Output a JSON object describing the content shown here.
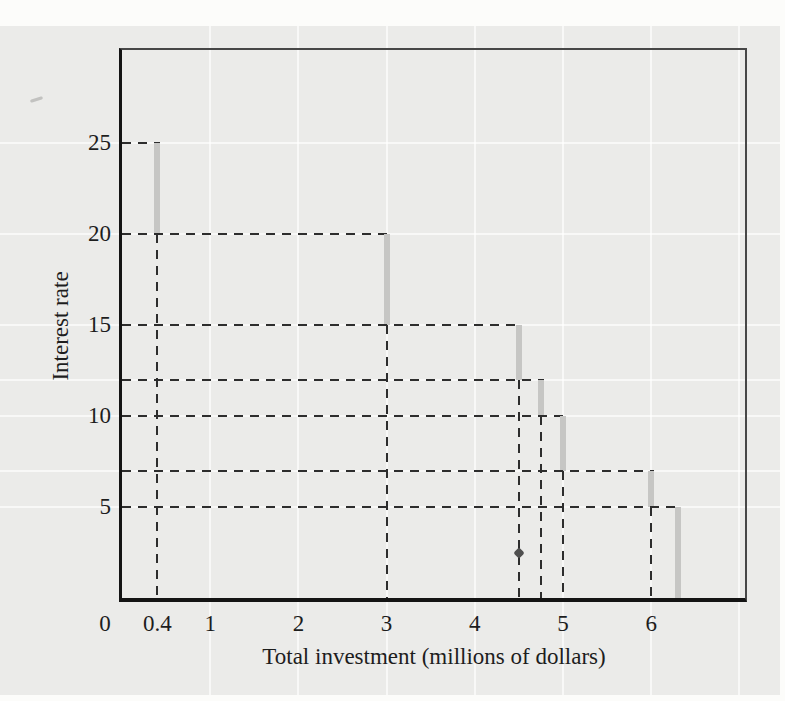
{
  "figure": {
    "x_axis_title": "Total investment (millions of dollars)",
    "y_axis_title": "Interest rate"
  },
  "chart_data": {
    "type": "line",
    "subtype": "descending-staircase-step-function",
    "title": "",
    "xlabel": "Total investment (millions of dollars)",
    "ylabel": "Interest rate",
    "xlim": [
      0,
      7.1
    ],
    "ylim": [
      0,
      30
    ],
    "grid": "faint white gridlines on light gray panel",
    "legend_position": "none",
    "x_ticks": [
      {
        "v": 0,
        "label": "0"
      },
      {
        "v": 0.4,
        "label": "0.4"
      },
      {
        "v": 1,
        "label": "1"
      },
      {
        "v": 2,
        "label": "2"
      },
      {
        "v": 3,
        "label": "3"
      },
      {
        "v": 4,
        "label": "4"
      },
      {
        "v": 5,
        "label": "5"
      },
      {
        "v": 6,
        "label": "6"
      }
    ],
    "y_ticks": [
      {
        "v": 25,
        "label": "25"
      },
      {
        "v": 20,
        "label": "20"
      },
      {
        "v": 15,
        "label": "15"
      },
      {
        "v": 10,
        "label": "10"
      },
      {
        "v": 5,
        "label": "5"
      }
    ],
    "steps": [
      {
        "x": 0.4,
        "y_from": 25,
        "y_to": 20
      },
      {
        "x": 3,
        "y_from": 20,
        "y_to": 15
      },
      {
        "x": 4.5,
        "y_from": 15,
        "y_to": 12
      },
      {
        "x": 4.75,
        "y_from": 12,
        "y_to": 10
      },
      {
        "x": 5,
        "y_from": 10,
        "y_to": 7
      },
      {
        "x": 6,
        "y_from": 7,
        "y_to": 5
      },
      {
        "x": 6.3,
        "y_from": 5,
        "y_to": 0
      }
    ],
    "dashed_guides": {
      "horizontal_from_y_axis_at_rates": [
        25,
        20,
        15,
        12,
        10,
        7,
        5
      ],
      "vertical_to_x_axis_at_investment": [
        0.4,
        3,
        4.5,
        4.75,
        5,
        6
      ]
    },
    "grid_x_units": [
      1,
      2,
      3,
      4,
      5,
      6,
      7
    ],
    "grid_y_values": [
      25,
      20,
      15,
      12,
      10,
      7,
      5
    ],
    "artifact_marker": {
      "x": 4.5,
      "y": 2.45
    },
    "colors": {
      "panel_background": "#ebebe9",
      "page_background": "#fcfcfa",
      "step_bar_gray": "#c6c6c4",
      "dashed_line": "#2d2d2d",
      "axis_line": "#141414",
      "frame_line": "#474747",
      "white_gridline": "#ffffff",
      "text": "#1d1d1d"
    }
  }
}
